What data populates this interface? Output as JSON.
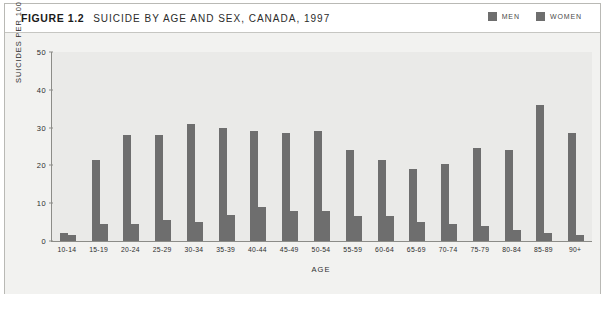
{
  "figure": {
    "number": "FIGURE 1.2",
    "title": "SUICIDE BY AGE AND SEX, CANADA, 1997"
  },
  "legend": {
    "position": "top-right",
    "items": [
      {
        "label": "MEN",
        "color": "#6e6e6e"
      },
      {
        "label": "WOMEN",
        "color": "#6e6e6e"
      }
    ]
  },
  "axes": {
    "y_title": "SUICIDES PER 100 000 PEOPLE",
    "x_title": "AGE",
    "y_ticks": [
      "0",
      "10",
      "20",
      "30",
      "40",
      "50"
    ]
  },
  "chart_data": {
    "type": "bar",
    "title": "SUICIDE BY AGE AND SEX, CANADA, 1997",
    "xlabel": "AGE",
    "ylabel": "SUICIDES PER 100 000 PEOPLE",
    "ylim": [
      0,
      50
    ],
    "yticks": [
      0,
      10,
      20,
      30,
      40,
      50
    ],
    "grid": false,
    "legend_position": "top-right",
    "categories": [
      "10-14",
      "15-19",
      "20-24",
      "25-29",
      "30-34",
      "35-39",
      "40-44",
      "45-49",
      "50-54",
      "55-59",
      "60-64",
      "65-69",
      "70-74",
      "75-79",
      "80-84",
      "85-89",
      "90+"
    ],
    "series": [
      {
        "name": "MEN",
        "color": "#6e6e6e",
        "values": [
          2,
          21.5,
          28,
          28,
          31,
          30,
          29,
          28.5,
          29,
          24,
          21.5,
          19,
          20.5,
          24.5,
          24,
          36,
          28.5
        ]
      },
      {
        "name": "WOMEN",
        "color": "#6e6e6e",
        "values": [
          1.5,
          4.5,
          4.5,
          5.5,
          5,
          7,
          9,
          8,
          8,
          6.5,
          6.5,
          5,
          4.5,
          4,
          3,
          2,
          1.5
        ]
      }
    ]
  }
}
